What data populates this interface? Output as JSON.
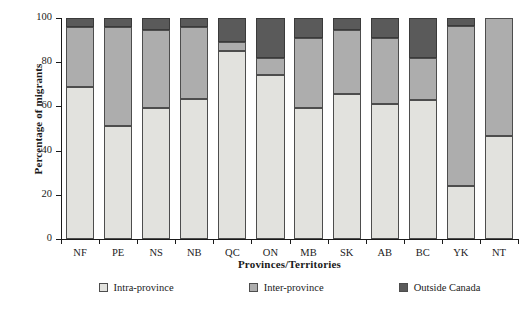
{
  "chart_data": {
    "type": "bar",
    "title": "",
    "xlabel": "Provinces/Territories",
    "ylabel": "Percentage of migrants",
    "ylim": [
      0,
      100
    ],
    "yticks": [
      0,
      20,
      40,
      60,
      80,
      100
    ],
    "grid": false,
    "stacked": true,
    "legend_position": "bottom",
    "categories": [
      "NF",
      "PE",
      "NS",
      "NB",
      "QC",
      "ON",
      "MB",
      "SK",
      "AB",
      "BC",
      "YK",
      "NT"
    ],
    "series": [
      {
        "name": "Intra-province",
        "color": "#e2e2de",
        "values": [
          69,
          51,
          59.5,
          63.5,
          85,
          74,
          59.5,
          65.5,
          61,
          63,
          24,
          46.5
        ]
      },
      {
        "name": "Inter-province",
        "color": "#adadad",
        "values": [
          27,
          45,
          35,
          32.5,
          4,
          8,
          31.5,
          29,
          30,
          19,
          72.5,
          53.5
        ]
      },
      {
        "name": "Outside Canada",
        "color": "#5a5a5a",
        "values": [
          4,
          4,
          5.5,
          4,
          11,
          18,
          9,
          5.5,
          9,
          18,
          3.5,
          0
        ]
      }
    ]
  },
  "axes": {
    "y_tick_labels": [
      "0",
      "20",
      "40",
      "60",
      "80",
      "100"
    ],
    "x_tick_labels": [
      "NF",
      "PE",
      "NS",
      "NB",
      "QC",
      "ON",
      "MB",
      "SK",
      "AB",
      "BC",
      "YK",
      "NT"
    ],
    "y_axis_title": "Percentage of migrants",
    "x_axis_title": "Provinces/Territories"
  },
  "legend": {
    "items": [
      {
        "label": "Intra-province",
        "color": "#e2e2de"
      },
      {
        "label": "Inter-province",
        "color": "#adadad"
      },
      {
        "label": "Outside Canada",
        "color": "#5a5a5a"
      }
    ]
  }
}
